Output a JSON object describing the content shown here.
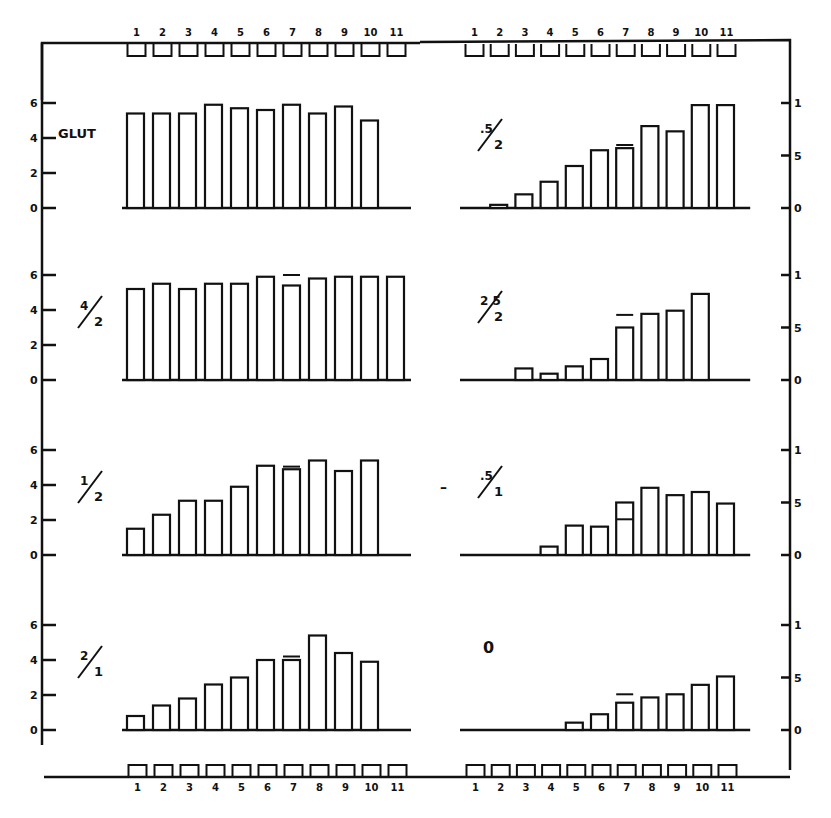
{
  "chart_data": {
    "type": "bar",
    "layout": "2 columns x 4 rows of small-multiple bar charts inside a common frame",
    "categories": [
      "1",
      "2",
      "3",
      "4",
      "5",
      "6",
      "7",
      "8",
      "9",
      "10",
      "11"
    ],
    "top_tick_labels_left": [
      "1",
      "2",
      "3",
      "4",
      "5",
      "6",
      "7",
      "8",
      "9",
      "10",
      "11"
    ],
    "top_tick_labels_right": [
      "1",
      "2",
      "3",
      "4",
      "5",
      "6",
      "7",
      "8",
      "9",
      "10",
      "11"
    ],
    "bottom_tick_labels_left": [
      "1",
      "2",
      "3",
      "4",
      "5",
      "6",
      "7",
      "8",
      "9",
      "10",
      "11"
    ],
    "bottom_tick_labels_right": [
      "1",
      "2",
      "3",
      "4",
      "5",
      "6",
      "7",
      "8",
      "9",
      "10",
      "11"
    ],
    "left_axis": {
      "ticks": [
        0,
        2,
        4,
        6
      ],
      "tick_labels": [
        "0",
        "2",
        "4",
        "6"
      ],
      "ylim": [
        0,
        6.5
      ]
    },
    "right_axis": {
      "ticks": [
        0,
        0.5,
        1
      ],
      "tick_labels": [
        "0",
        "5",
        "1"
      ],
      "ylim": [
        0,
        1.1
      ]
    },
    "grid": false,
    "legend": null,
    "panels": [
      {
        "id": "glut",
        "column": "left",
        "row": 1,
        "label": "GLUT",
        "label_type": "text",
        "values": [
          5.4,
          5.4,
          5.4,
          5.9,
          5.7,
          5.6,
          5.9,
          5.4,
          5.8,
          5.0,
          null
        ],
        "markers": []
      },
      {
        "id": "r05_2",
        "column": "right",
        "row": 1,
        "label": ".5/2",
        "label_num": ".5",
        "label_den": "2",
        "label_type": "fraction",
        "values": [
          0.0,
          0.03,
          0.13,
          0.25,
          0.4,
          0.55,
          0.57,
          0.78,
          0.73,
          0.98,
          0.98
        ],
        "markers": [
          {
            "category": "7",
            "value": 0.6
          }
        ]
      },
      {
        "id": "r4_2",
        "column": "left",
        "row": 2,
        "label": "4/2",
        "label_num": "4",
        "label_den": "2",
        "label_type": "fraction",
        "values": [
          5.2,
          5.5,
          5.2,
          5.5,
          5.5,
          5.9,
          5.4,
          5.8,
          5.9,
          5.9,
          5.9
        ],
        "markers": [
          {
            "category": "7",
            "value": 6.0
          }
        ]
      },
      {
        "id": "r25_2",
        "column": "right",
        "row": 2,
        "label": "25/2",
        "label_num": "2 5",
        "label_den": "2",
        "label_type": "fraction",
        "values": [
          0.0,
          0.0,
          0.11,
          0.06,
          0.13,
          0.2,
          0.5,
          0.63,
          0.66,
          0.82,
          null
        ],
        "markers": [
          {
            "category": "7",
            "value": 0.62
          }
        ]
      },
      {
        "id": "r1_2",
        "column": "left",
        "row": 3,
        "label": "1/2",
        "label_num": "1",
        "label_den": "2",
        "label_type": "fraction",
        "values": [
          1.5,
          2.3,
          3.1,
          3.1,
          3.9,
          5.1,
          4.9,
          5.4,
          4.8,
          5.4,
          null
        ],
        "markers": [
          {
            "category": "7",
            "value": 5.05
          }
        ]
      },
      {
        "id": "r05_1",
        "column": "right",
        "row": 3,
        "label": ".5/1",
        "label_num": ".5",
        "label_den": "1",
        "label_type": "fraction",
        "values": [
          0.0,
          0.0,
          0.0,
          0.08,
          0.28,
          0.27,
          0.5,
          0.64,
          0.57,
          0.6,
          0.49
        ],
        "markers": [
          {
            "category": "7",
            "value": 0.34
          }
        ]
      },
      {
        "id": "r2_1",
        "column": "left",
        "row": 4,
        "label": "2/1",
        "label_num": "2",
        "label_den": "1",
        "label_type": "fraction",
        "values": [
          0.8,
          1.4,
          1.8,
          2.6,
          3.0,
          4.0,
          4.0,
          5.4,
          4.4,
          3.9,
          null
        ],
        "markers": [
          {
            "category": "7",
            "value": 4.2
          }
        ]
      },
      {
        "id": "r0",
        "column": "right",
        "row": 4,
        "label": "0",
        "label_type": "text",
        "values": [
          0.0,
          0.0,
          0.0,
          0.0,
          0.07,
          0.15,
          0.26,
          0.31,
          0.34,
          0.43,
          0.51
        ],
        "markers": [
          {
            "category": "7",
            "value": 0.34
          }
        ]
      }
    ],
    "title": "",
    "xlabel": "",
    "ylabel": ""
  },
  "annotations": {
    "stray_mark": "–"
  }
}
